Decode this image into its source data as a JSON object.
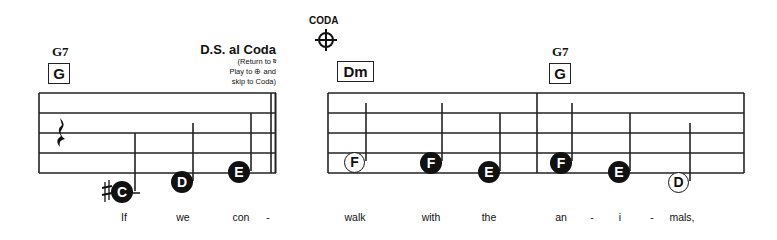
{
  "score": {
    "measures": [
      {
        "chord_name": "G7",
        "chord_box": "G"
      },
      {
        "chord_name": "",
        "chord_box": "Dm"
      },
      {
        "chord_name": "G7",
        "chord_box": "G"
      }
    ],
    "ds_al_coda": {
      "title": "D.S. al Coda",
      "line1": "(Return to 𝄋",
      "line2": "Play to ⊕ and",
      "line3": "skip to Coda)"
    },
    "coda": {
      "label": "CODA",
      "symbol": "⊕"
    },
    "notes": [
      {
        "letter": "C",
        "accidental": "♯",
        "filled": true
      },
      {
        "letter": "D",
        "filled": true
      },
      {
        "letter": "E",
        "filled": true
      },
      {
        "letter": "F",
        "filled": false
      },
      {
        "letter": "F",
        "filled": true
      },
      {
        "letter": "E",
        "filled": true
      },
      {
        "letter": "F",
        "filled": true
      },
      {
        "letter": "E",
        "filled": true
      },
      {
        "letter": "D",
        "filled": false
      }
    ],
    "lyrics": [
      "If",
      "we",
      "con",
      "-",
      "walk",
      "with",
      "the",
      "an",
      "-",
      "i",
      "-",
      "mals,"
    ]
  }
}
